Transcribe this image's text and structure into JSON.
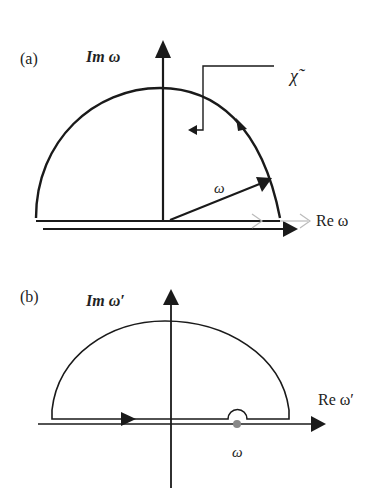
{
  "panel_a": {
    "label": "(a)",
    "im_axis": "Im ω",
    "re_axis": "Re ω",
    "omega": "ω",
    "chi": "χ̃"
  },
  "panel_b": {
    "label": "(b)",
    "im_axis": "Im ω′",
    "re_axis": "Re ω′",
    "omega": "ω"
  },
  "colors": {
    "stroke": "#1a1a1a",
    "ghost_arrow": "#bbbbbb",
    "pole": "#888888"
  }
}
